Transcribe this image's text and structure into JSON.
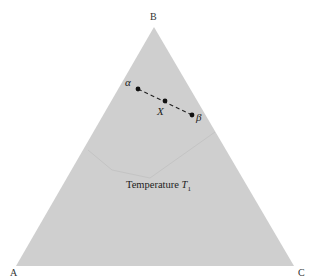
{
  "diagram": {
    "type": "ternary-phase-diagram",
    "fill_color": "#cfcfcf",
    "artifact_color": "#c4c4c4",
    "vertices": {
      "A": {
        "label": "A"
      },
      "B": {
        "label": "B"
      },
      "C": {
        "label": "C"
      }
    },
    "title": {
      "text": "Temperature ",
      "symbol": "T",
      "subscript": "1"
    },
    "tie_line": {
      "style": "dashed",
      "points": [
        {
          "id": "alpha",
          "label": "α"
        },
        {
          "id": "X",
          "label": "X"
        },
        {
          "id": "beta",
          "label": "β"
        }
      ]
    }
  }
}
